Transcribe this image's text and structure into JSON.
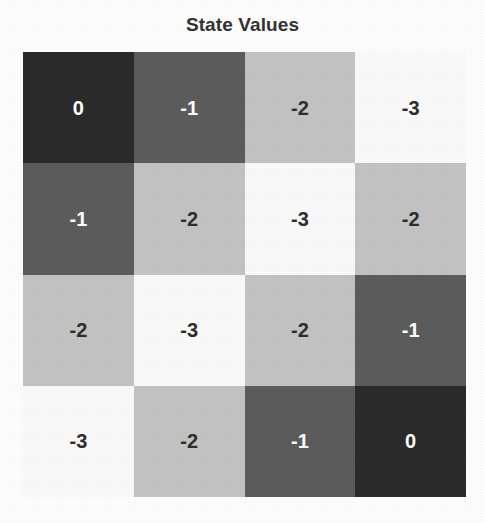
{
  "figure": {
    "title": "State Values",
    "background_color": "#ffffff",
    "title_color": "#333333"
  },
  "chart_data": {
    "type": "heatmap",
    "title": "State Values",
    "xlabel": "",
    "ylabel": "",
    "rows": 4,
    "cols": 4,
    "grid_on": false,
    "legend": "none",
    "colormap": "gray",
    "colorbar": false,
    "zlim": [
      -3,
      0
    ],
    "row_labels": [
      "",
      "",
      "",
      ""
    ],
    "col_labels": [
      "",
      "",
      "",
      ""
    ],
    "values": [
      [
        0,
        -1,
        -2,
        -3
      ],
      [
        -1,
        -2,
        -3,
        -2
      ],
      [
        -2,
        -3,
        -2,
        -1
      ],
      [
        -3,
        -2,
        -1,
        0
      ]
    ],
    "cell_text": [
      [
        "0",
        "-1",
        "-2",
        "-3"
      ],
      [
        "-1",
        "-2",
        "-3",
        "-2"
      ],
      [
        "-2",
        "-3",
        "-2",
        "-1"
      ],
      [
        "-3",
        "-2",
        "-1",
        "0"
      ]
    ],
    "value_colors": {
      "0": "#2b2b2b",
      "-1": "#5c5c5c",
      "-2": "#c4c4c4",
      "-3": "#fbfbfb"
    },
    "value_text_colors": {
      "0": "#ffffff",
      "-1": "#ffffff",
      "-2": "#2e2e2e",
      "-3": "#2e2e2e"
    }
  }
}
